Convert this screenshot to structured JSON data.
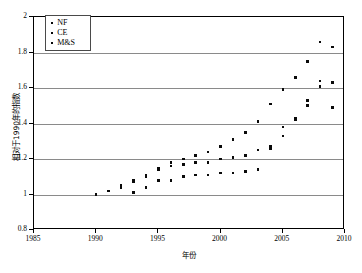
{
  "chart_data": {
    "type": "scatter",
    "title": "",
    "xlabel": "年份",
    "ylabel": "相对于1990年的指数",
    "xlim": [
      1985,
      2010
    ],
    "ylim": [
      0.8,
      2.0
    ],
    "xticks": [
      1985,
      1990,
      1995,
      2000,
      2005,
      2010
    ],
    "yticks": [
      0.8,
      1,
      1.2,
      1.4,
      1.6,
      1.8,
      2
    ],
    "xtick_labels": [
      "1985",
      "1990",
      "1995",
      "2000",
      "2005",
      "2010"
    ],
    "ytick_labels": [
      "0.8",
      "1",
      "1.2",
      "1.4",
      "1.6",
      "1.8",
      "2"
    ],
    "grid": "horizontal",
    "legend_position": "top-left",
    "marker": "square",
    "marker_color": "#0a0a0a",
    "series": [
      {
        "name": "NF",
        "x": [
          1990,
          1991,
          1992,
          1993,
          1994,
          1995,
          1996,
          1997,
          1998,
          1999,
          2000,
          2001,
          2002,
          2003,
          2004,
          2005,
          2006,
          2007,
          2008,
          2009
        ],
        "y": [
          1.0,
          1.02,
          1.05,
          1.08,
          1.11,
          1.15,
          1.18,
          1.2,
          1.22,
          1.24,
          1.27,
          1.31,
          1.35,
          1.41,
          1.51,
          1.59,
          1.66,
          1.75,
          1.86,
          1.83
        ]
      },
      {
        "name": "CE",
        "x": [
          1990,
          1991,
          1992,
          1993,
          1994,
          1995,
          1996,
          1997,
          1998,
          1999,
          2000,
          2001,
          2002,
          2003,
          2004,
          2005,
          2006,
          2007,
          2008,
          2009
        ],
        "y": [
          1.0,
          1.02,
          1.04,
          1.07,
          1.1,
          1.14,
          1.16,
          1.17,
          1.18,
          1.18,
          1.2,
          1.21,
          1.22,
          1.25,
          1.27,
          1.33,
          1.43,
          1.5,
          1.61,
          1.63
        ]
      },
      {
        "name": "M&S",
        "x": [
          1990,
          1991,
          1992,
          1993,
          1994,
          1995,
          1996,
          1997,
          1998,
          1999,
          2000,
          2001,
          2002,
          2003,
          2004,
          2005,
          2006,
          2007,
          2008,
          2009
        ],
        "y": [
          1.0,
          1.02,
          1.04,
          1.01,
          1.04,
          1.08,
          1.08,
          1.1,
          1.11,
          1.11,
          1.12,
          1.12,
          1.13,
          1.14,
          1.26,
          1.38,
          1.42,
          1.53,
          1.64,
          1.49
        ]
      }
    ]
  },
  "legend": {
    "entries": [
      {
        "label": "NF"
      },
      {
        "label": "CE"
      },
      {
        "label": "M&S"
      }
    ]
  }
}
